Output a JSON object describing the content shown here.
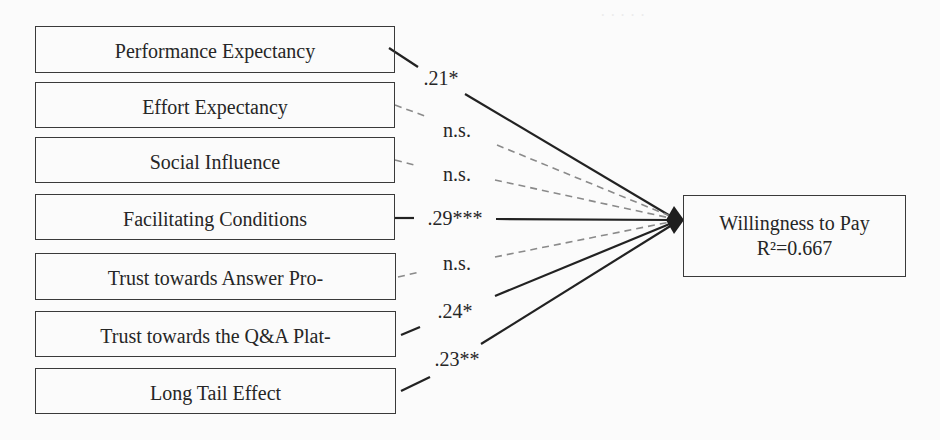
{
  "diagram": {
    "type": "path-model",
    "predictors": [
      {
        "label": "Performance Expectancy",
        "coef": ".21*",
        "significant": true
      },
      {
        "label": "Effort Expectancy",
        "coef": "n.s.",
        "significant": false
      },
      {
        "label": "Social Influence",
        "coef": "n.s.",
        "significant": false
      },
      {
        "label": "Facilitating Conditions",
        "coef": ".29***",
        "significant": true
      },
      {
        "label": "Trust towards Answer Pro-",
        "coef": "n.s.",
        "significant": false
      },
      {
        "label": "Trust towards the Q&A Plat-",
        "coef": ".24*",
        "significant": true
      },
      {
        "label": "Long Tail Effect",
        "coef": ".23**",
        "significant": true
      }
    ],
    "outcome": {
      "label": "Willingness to Pay",
      "r_squared": "R²=0.667"
    },
    "legend_styles": {
      "significant_line": "solid",
      "nonsignificant_line": "dashed",
      "line_color": "#222222",
      "dashed_color": "#8a8a8a"
    }
  }
}
